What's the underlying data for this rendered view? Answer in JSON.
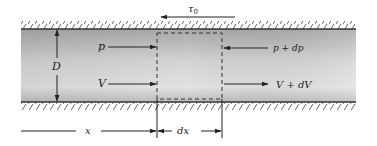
{
  "diagram": {
    "type": "fluid-control-volume-pipe",
    "labels": {
      "shear_stress": "τ",
      "shear_stress_sub": "0",
      "diameter": "D",
      "pressure_in": "p",
      "pressure_out": "p + dp",
      "velocity_in": "V",
      "velocity_out": "V + dV",
      "position": "x",
      "element_length": "dx"
    },
    "colors": {
      "wall_line": "#333333",
      "hatch": "#555555",
      "fluid_dark": "#9a9a9a",
      "fluid_light": "#e6e6e6",
      "arrow": "#222222",
      "dashed_box": "#333333"
    }
  }
}
